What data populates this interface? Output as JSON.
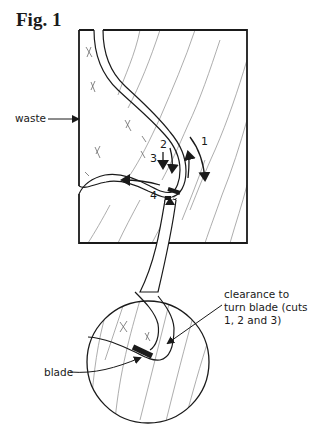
{
  "figure": {
    "title": "Fig. 1"
  },
  "labels": {
    "waste": "waste",
    "clearance_line1": "clearance to",
    "clearance_line2": "turn blade (cuts",
    "clearance_line3": "1, 2 and 3)",
    "blade": "blade"
  },
  "cut_numbers": {
    "cut1": "1",
    "cut2": "2",
    "cut3": "3",
    "cut4": "4"
  },
  "colors": {
    "ink": "#1a1a1a",
    "grain": "#8a8a8a",
    "background": "#ffffff"
  }
}
